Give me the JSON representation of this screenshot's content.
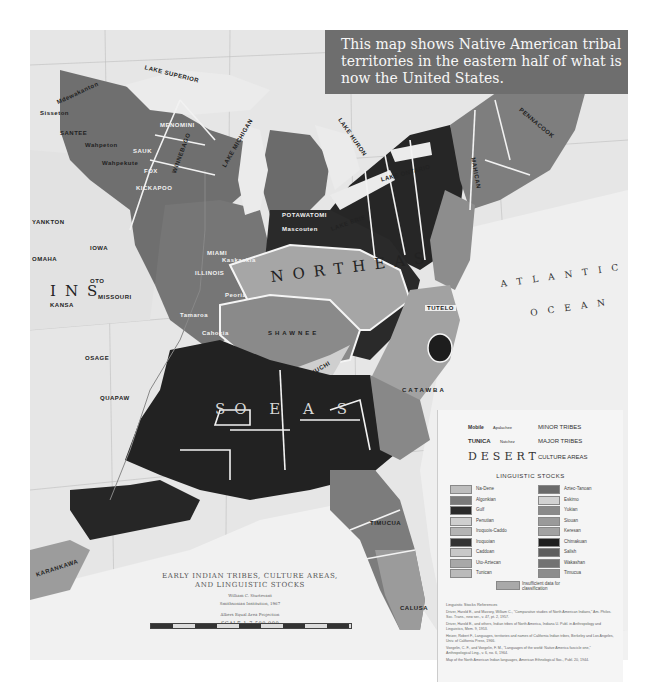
{
  "caption": {
    "text": "This map shows Native American tribal territories in the eastern half of what is now the United States."
  },
  "map": {
    "title_line1": "EARLY INDIAN TRIBES, CULTURE AREAS,",
    "title_line2": "AND LINGUISTIC STOCKS",
    "author": "William C. Sturtevant",
    "author_affiliation": "Smithsonian Institution, 1967",
    "projection": "Albers Equal Area Projection",
    "scale": "SCALE 1:7,500,000",
    "culture_areas": [
      "NORTHEAST",
      "SOUTHEAST",
      "PLAINS"
    ],
    "culture_area_labels": {
      "northeast": "NORTHEAS",
      "southeast": "SO    E A S",
      "plains": "INS"
    },
    "ocean_labels": {
      "atlantic": "ATLANTIC",
      "ocean": "OCEAN"
    },
    "lakes": [
      "LAKE SUPERIOR",
      "LAKE MICHIGAN",
      "LAKE HURON",
      "LAKE ERIE",
      "LAKE ONTARIO"
    ],
    "tribes": {
      "menomini": "MENOMINI",
      "sauk": "SAUK",
      "fox": "FOX",
      "kickapoo": "KICKAPOO",
      "winnebago": "WINNEBAGO",
      "potawatomi": "POTAWATOMI",
      "mascouten": "Mascouten",
      "miami": "MIAMI",
      "illinois": "ILLINOIS",
      "kaskaskia": "Kaskaskia",
      "peoria": "Peoria",
      "tamaroa": "Tamaroa",
      "cahokia": "Cahokia",
      "shawnee": "SHAWNEE",
      "yuchi": "YUCHI",
      "tutelo": "TUTELO",
      "catawba": "CATAWBA",
      "timucua": "TIMUCUA",
      "calusa": "CALUSA",
      "quapaw": "QUAPAW",
      "osage": "OSAGE",
      "missouri": "MISSOURI",
      "kansa": "KANSA",
      "oto": "OTO",
      "iowa": "IOWA",
      "omaha": "OMAHA",
      "yankton": "YANKTON",
      "santee": "SANTEE",
      "wahpeton": "Wahpeton",
      "wahpekute": "Wahpekute",
      "sisseton": "Sisseton",
      "mdewakanton": "Mdewakanton",
      "chippewa_area": "Ojibwa of the Woods",
      "karankawa": "KARANKAWA",
      "caddo": "CADDO",
      "mahican": "MAHICAN",
      "pennacook": "PENNACOOK",
      "mohegan": "Mohegan",
      "delaware": "Delaware",
      "monacan": "Monacan",
      "hasinai": "Hasinai"
    }
  },
  "legend": {
    "type_samples": [
      {
        "sample": "Mobile",
        "sample_sub": "Apalachee",
        "desc": "MINOR TRIBES"
      },
      {
        "sample": "TUNICA",
        "sample_sub": "Natchez",
        "desc": "MAJOR TRIBES"
      },
      {
        "sample": "DESERT",
        "desc": "CULTURE AREAS"
      }
    ],
    "stocks_title": "LINGUISTIC STOCKS",
    "stocks_left": [
      {
        "name": "Na-Dene",
        "color": "#bdbdbd"
      },
      {
        "name": "Algonkian",
        "color": "#7a7a7a"
      },
      {
        "name": "Gulf",
        "color": "#2a2a2a"
      },
      {
        "name": "Penutian",
        "color": "#cfcfcf"
      },
      {
        "name": "Iroquois-Caddo",
        "color": "#b4b4b4"
      },
      {
        "name": "Iroquoian",
        "color": "#333333"
      },
      {
        "name": "Caddoan",
        "color": "#c8c8c8"
      },
      {
        "name": "Uto-Aztecan",
        "color": "#a8a8a8"
      },
      {
        "name": "Tunican",
        "color": "#bababa"
      }
    ],
    "stocks_right": [
      {
        "name": "Aztec-Tanoan",
        "color": "#6a6a6a"
      },
      {
        "name": "Eskimo",
        "color": "#d2d2d2"
      },
      {
        "name": "Yukian",
        "color": "#8a8a8a"
      },
      {
        "name": "Siouan",
        "color": "#9a9a9a"
      },
      {
        "name": "Keresan",
        "color": "#a2a2a2"
      },
      {
        "name": "Chimakuan",
        "color": "#1e1e1e"
      },
      {
        "name": "Salish",
        "color": "#5e5e5e"
      },
      {
        "name": "Wakashan",
        "color": "#727272"
      },
      {
        "name": "Timucua",
        "color": "#8c8c8c"
      }
    ],
    "unknown": {
      "label": "Insufficient data for classification",
      "color": "#a9a9a9"
    },
    "references_title": "Linguistic Stocks References",
    "references": [
      "Driver, Harold E., and Massey, William C., \"Comparative studies of North American Indians,\" Am. Philos. Soc. Trans., new ser., v. 47, pt. 2, 1957.",
      "Driver, Harold E., and others, Indian tribes of North America, Indiana U. Publ. in Anthropology and Linguistics, Mem. 9, 1953.",
      "Heizer, Robert F., Languages, territories and names of California Indian tribes, Berkeley and Los Angeles, Univ. of California Press, 1966.",
      "Voegelin, C. F., and Voegelin, F. M., \"Languages of the world: Native America fascicle one,\" Anthropological Ling., v. 6, no. 6, 1964.",
      "Map of the North American Indian languages, American Ethnological Soc., Publ. 20, 1944."
    ]
  }
}
